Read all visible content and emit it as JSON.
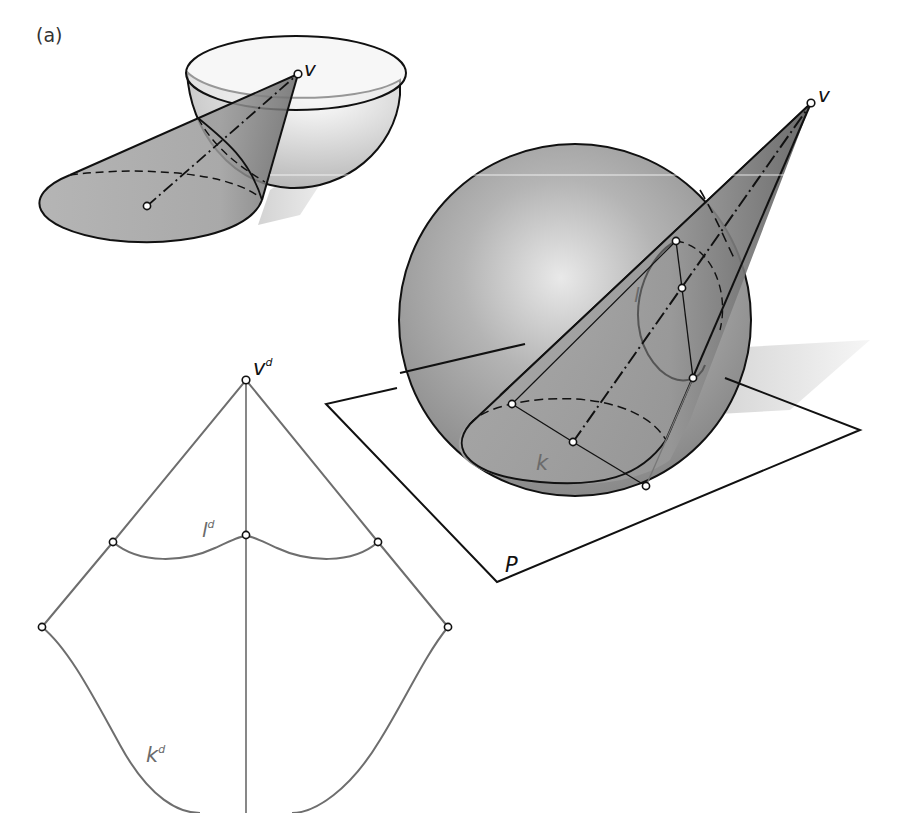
{
  "figure": {
    "panel_label": "(a)",
    "colors": {
      "ink": "#111111",
      "development_line": "#6e6e6e",
      "surface_fill": "#9a9a9a",
      "sphere_highlight": "#e6e6e6",
      "label_grey": "#6b6b6b"
    }
  },
  "bowl_cone": {
    "vertex_label": "v"
  },
  "sphere_cone": {
    "vertex_label": "v",
    "upper_curve_label": "l",
    "lower_curve_label": "k",
    "plane_label": "P"
  },
  "development": {
    "vertex_label": "v",
    "vertex_sup": "d",
    "upper_curve_label": "l",
    "upper_curve_sup": "d",
    "lower_curve_label": "k",
    "lower_curve_sup": "d"
  }
}
